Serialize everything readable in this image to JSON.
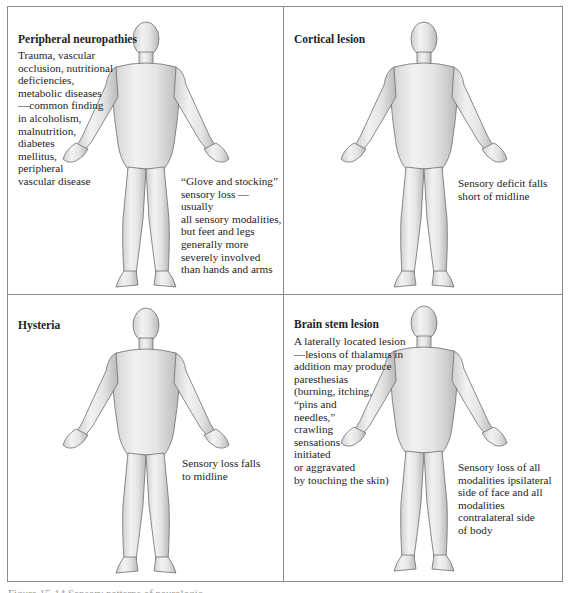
{
  "figure": {
    "panels": [
      {
        "id": "peripheral-neuropathies",
        "title": "Peripheral neuropathies",
        "causes_text": "Trauma, vascular\nocclusion, nutritional\ndeficiencies,\nmetabolic diseases\n—common finding\nin alcoholism,\nmalnutrition,\ndiabetes\nmellitus,\nperipheral\nvascular disease",
        "pattern_text": "“Glove and stocking”\nsensory loss — usually\nall sensory modalities,\nbut feet and legs\ngenerally more\nseverely involved\nthan hands and arms",
        "shading": "distal-hands-feet"
      },
      {
        "id": "cortical-lesion",
        "title": "Cortical lesion",
        "pattern_text": "Sensory deficit falls\nshort of midline",
        "shading": "half-body-short-of-midline"
      },
      {
        "id": "hysteria",
        "title": "Hysteria",
        "pattern_text": "Sensory loss falls\nto midline",
        "shading": "half-body-exact-midline"
      },
      {
        "id": "brain-stem-lesion",
        "title": "Brain stem lesion",
        "causes_text": "A laterally located lesion\n—lesions of thalamus in\naddition may produce\nparesthesias\n(burning, itching,\n“pins and\nneedles,”\ncrawling\nsensations\ninitiated\nor aggravated\nby touching the skin)",
        "pattern_text": "Sensory loss of all\nmodalities ipsilateral\nside of face and all\nmodalities\ncontralateral side\nof body",
        "shading": "ipsilateral-face-contralateral-body"
      }
    ],
    "caption": "Figure 15-14  Sensory patterns of neurologic ..."
  },
  "colors": {
    "border": "#8a8a8a",
    "skin_light": "#ececec",
    "skin_mid": "#b9b9b9",
    "deficit_dark": "#5e5e5e",
    "text": "#1e1e1e"
  }
}
